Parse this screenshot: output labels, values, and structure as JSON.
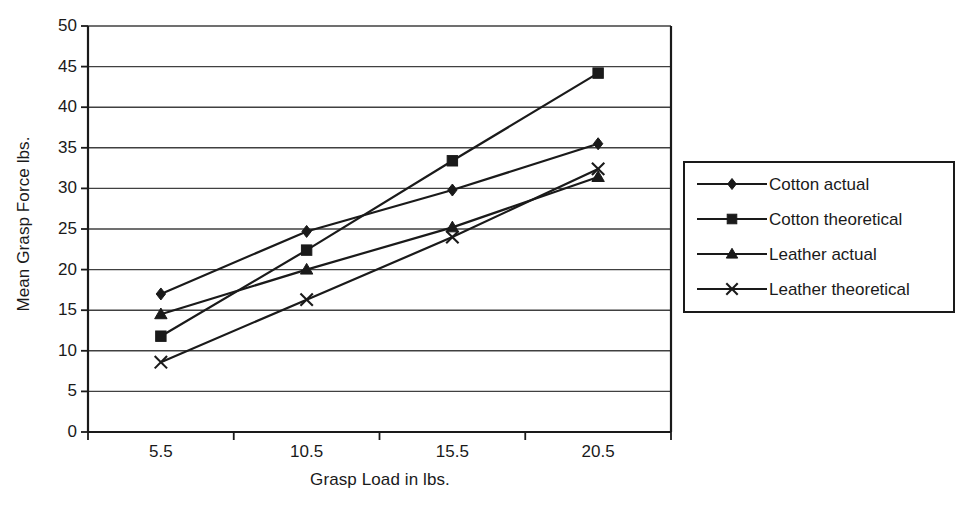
{
  "chart_data": {
    "type": "line",
    "title": "",
    "xlabel": "Grasp Load in lbs.",
    "ylabel": "Mean Grasp Force lbs.",
    "categories": [
      "5.5",
      "10.5",
      "15.5",
      "20.5"
    ],
    "x": [
      5.5,
      10.5,
      15.5,
      20.5
    ],
    "ylim": [
      0,
      50
    ],
    "ytick_values": [
      0,
      5,
      10,
      15,
      20,
      25,
      30,
      35,
      40,
      45,
      50
    ],
    "ytick_labels": [
      "0",
      "5",
      "10",
      "15",
      "20",
      "25",
      "30",
      "35",
      "40",
      "45",
      "50"
    ],
    "grid": "horizontal",
    "legend_position": "right",
    "series": [
      {
        "name": "Cotton actual",
        "marker": "diamond",
        "values": [
          17.0,
          24.7,
          29.8,
          35.5
        ]
      },
      {
        "name": "Cotton theoretical",
        "marker": "square",
        "values": [
          11.8,
          22.4,
          33.4,
          44.2
        ]
      },
      {
        "name": "Leather actual",
        "marker": "triangle",
        "values": [
          14.5,
          20.0,
          25.2,
          31.4
        ]
      },
      {
        "name": "Leather theoretical",
        "marker": "x",
        "values": [
          8.6,
          16.3,
          24.0,
          32.4
        ]
      }
    ],
    "colors": {
      "line": "#1a1a1a",
      "grid": "#404040",
      "axis": "#1a1a1a",
      "background": "#ffffff"
    }
  },
  "legend": {
    "items": [
      {
        "label": "Cotton actual",
        "marker": "diamond-marker"
      },
      {
        "label": "Cotton theoretical",
        "marker": "square-marker"
      },
      {
        "label": "Leather actual",
        "marker": "triangle-marker"
      },
      {
        "label": "Leather theoretical",
        "marker": "x-marker"
      }
    ]
  }
}
